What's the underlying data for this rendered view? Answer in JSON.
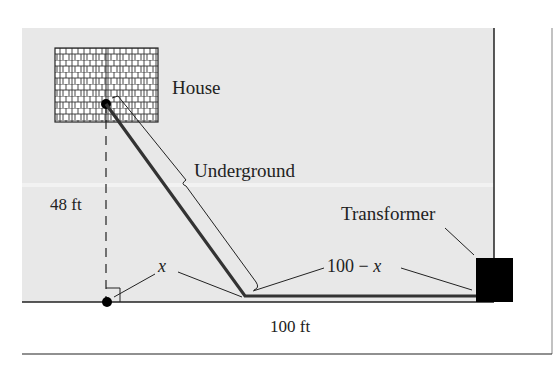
{
  "labels": {
    "house": "House",
    "underground": "Underground",
    "height": "48 ft",
    "x": "x",
    "remaining": "100 − x",
    "transformer": "Transformer",
    "total_width": "100 ft"
  },
  "colors": {
    "background_field": "#e8e8e8",
    "line": "#222222",
    "cable": "#333333",
    "transformer": "#000000"
  },
  "geometry": {
    "height_ft": 48,
    "total_ft": 100
  }
}
